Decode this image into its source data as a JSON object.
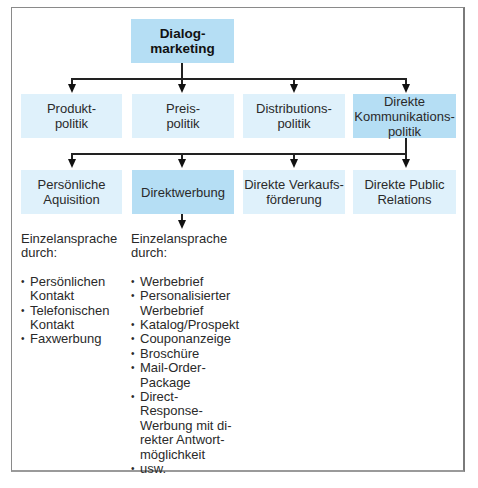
{
  "diagram": {
    "root": {
      "label": "Dialog-\nmarketing",
      "line1": "Dialog-",
      "line2": "marketing"
    },
    "level1": [
      {
        "line1": "Produkt-",
        "line2": "politik",
        "line3": ""
      },
      {
        "line1": "Preis-",
        "line2": "politik",
        "line3": ""
      },
      {
        "line1": "Distributions-",
        "line2": "politik",
        "line3": ""
      },
      {
        "line1": "Direkte",
        "line2": "Kommunikations-",
        "line3": "politik",
        "highlighted": true
      }
    ],
    "level2": [
      {
        "line1": "Persönliche",
        "line2": "Aquisition"
      },
      {
        "line1": "Direktwerbung",
        "line2": "",
        "highlighted": true
      },
      {
        "line1": "Direkte Verkaufs-",
        "line2": "förderung"
      },
      {
        "line1": "Direkte Public",
        "line2": "Relations"
      }
    ],
    "details": [
      {
        "intro_line1": "Einzelansprache",
        "intro_line2": "durch:",
        "items": [
          [
            "Persönlichen",
            "Kontakt"
          ],
          [
            "Telefonischen",
            "Kontakt"
          ],
          [
            "Faxwerbung"
          ]
        ]
      },
      {
        "intro_line1": "Einzelansprache",
        "intro_line2": "durch:",
        "items": [
          [
            "Werbebrief"
          ],
          [
            "Personalisierter",
            "Werbebrief"
          ],
          [
            "Katalog/Prospekt"
          ],
          [
            "Couponanzeige"
          ],
          [
            "Broschüre"
          ],
          [
            "Mail-Order-",
            "Package"
          ],
          [
            "Direct-Response-",
            "Werbung mit di-",
            "rekter Antwort-",
            "möglichkeit"
          ],
          [
            "usw."
          ]
        ]
      }
    ],
    "colors": {
      "light_box": "#dff1fb",
      "highlight_box": "#b5def4",
      "line": "#222222",
      "frame": "#8a8a8a"
    }
  }
}
